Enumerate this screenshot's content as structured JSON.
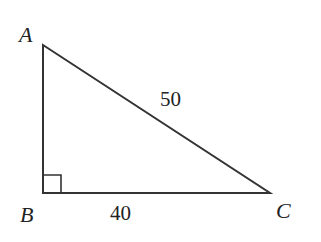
{
  "diagram": {
    "type": "right-triangle",
    "vertices": [
      {
        "label": "A",
        "x": 43,
        "y": 45
      },
      {
        "label": "B",
        "x": 43,
        "y": 193
      },
      {
        "label": "C",
        "x": 270,
        "y": 193
      }
    ],
    "right_angle_at": "B",
    "side_labels": {
      "AC": "50",
      "BC": "40"
    },
    "stroke_color": "#333333"
  }
}
